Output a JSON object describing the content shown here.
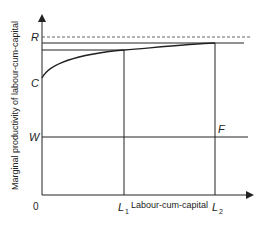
{
  "diagram": {
    "y_axis_label": "Marginal productivity of labour-cum-capital",
    "x_axis_label": "Labour-cum-capital",
    "origin_label": "0",
    "y_ticks": {
      "R": "R",
      "C": "C",
      "W": "W"
    },
    "x_ticks": {
      "L1_main": "L",
      "L1_sub": "1",
      "L2_main": "L",
      "L2_sub": "2"
    },
    "point_labels": {
      "F": "F"
    },
    "colors": {
      "line": "#222222",
      "dashed": "#555555",
      "background": "#ffffff"
    }
  }
}
